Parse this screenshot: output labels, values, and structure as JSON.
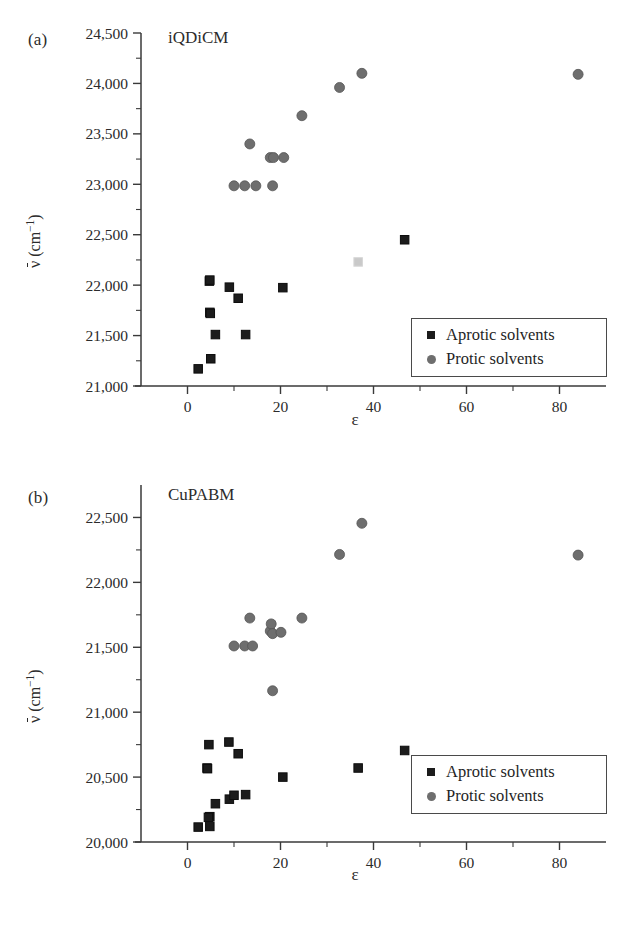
{
  "figure": {
    "xlabel": "ε",
    "ylabel_prefix": "ν",
    "ylabel_suffix": " (cm",
    "ylabel_exp": "−1",
    "ylabel_close": ")"
  },
  "legend": {
    "aprotic_label": "Aprotic solvents",
    "protic_label": "Protic solvents",
    "aprotic_color": "#1c1c1c",
    "protic_color": "#6e6e6e"
  },
  "chart_data": [
    {
      "type": "scatter",
      "panel": "(a)",
      "title": "iQDiCM",
      "xlabel": "ε",
      "ylabel": "ν̄ (cm⁻¹)",
      "xlim": [
        -10,
        90
      ],
      "ylim": [
        21000,
        24500
      ],
      "xticks": [
        0,
        20,
        40,
        60,
        80
      ],
      "xtick_labels": [
        "0",
        "20",
        "40",
        "60",
        "80"
      ],
      "xminor": [
        10,
        30,
        50,
        70
      ],
      "yticks": [
        21000,
        21500,
        22000,
        22500,
        23000,
        23500,
        24000,
        24500
      ],
      "ytick_labels": [
        "21,000",
        "21,500",
        "22,000",
        "22,500",
        "23,000",
        "23,500",
        "24,000",
        "24,500"
      ],
      "yminor": [
        21250,
        21750,
        22250,
        22750,
        23250,
        23750,
        24250
      ],
      "grid": false,
      "legend_position": "bottom-right",
      "series": [
        {
          "name": "Aprotic solvents",
          "marker": "square",
          "color": "#1c1c1c",
          "points": [
            {
              "x": 2.3,
              "y": 21170
            },
            {
              "x": 5.0,
              "y": 21270
            },
            {
              "x": 4.8,
              "y": 21730
            },
            {
              "x": 4.9,
              "y": 21720
            },
            {
              "x": 4.7,
              "y": 22040
            },
            {
              "x": 4.8,
              "y": 22050
            },
            {
              "x": 6.0,
              "y": 21510
            },
            {
              "x": 9.0,
              "y": 21980
            },
            {
              "x": 10.9,
              "y": 21870
            },
            {
              "x": 12.5,
              "y": 21510
            },
            {
              "x": 20.5,
              "y": 21975
            },
            {
              "x": 46.7,
              "y": 22450
            },
            {
              "x": 36.7,
              "y": 22230,
              "faint": true
            }
          ]
        },
        {
          "name": "Protic solvents",
          "marker": "circle",
          "color": "#6e6e6e",
          "points": [
            {
              "x": 10.0,
              "y": 22985
            },
            {
              "x": 12.3,
              "y": 22985
            },
            {
              "x": 14.7,
              "y": 22985
            },
            {
              "x": 18.3,
              "y": 22985
            },
            {
              "x": 13.4,
              "y": 23400
            },
            {
              "x": 17.8,
              "y": 23265
            },
            {
              "x": 18.5,
              "y": 23265
            },
            {
              "x": 20.7,
              "y": 23265
            },
            {
              "x": 24.6,
              "y": 23680
            },
            {
              "x": 32.7,
              "y": 23960
            },
            {
              "x": 37.5,
              "y": 24100
            },
            {
              "x": 84.0,
              "y": 24090
            }
          ]
        }
      ]
    },
    {
      "type": "scatter",
      "panel": "(b)",
      "title": "CuPABM",
      "xlabel": "ε",
      "ylabel": "ν̄ (cm⁻¹)",
      "xlim": [
        -10,
        90
      ],
      "ylim": [
        20000,
        22750
      ],
      "xticks": [
        0,
        20,
        40,
        60,
        80
      ],
      "xtick_labels": [
        "0",
        "20",
        "40",
        "60",
        "80"
      ],
      "xminor": [
        10,
        30,
        50,
        70
      ],
      "yticks": [
        20000,
        20500,
        21000,
        21500,
        22000,
        22500
      ],
      "ytick_labels": [
        "20,000",
        "20,500",
        "21,000",
        "21,500",
        "22,000",
        "22,500"
      ],
      "yminor": [
        20250,
        20750,
        21250,
        21750,
        22250
      ],
      "grid": false,
      "legend_position": "bottom-right",
      "series": [
        {
          "name": "Aprotic solvents",
          "marker": "square",
          "color": "#1c1c1c",
          "points": [
            {
              "x": 2.3,
              "y": 20115
            },
            {
              "x": 4.8,
              "y": 20120
            },
            {
              "x": 4.8,
              "y": 20195
            },
            {
              "x": 4.5,
              "y": 20190
            },
            {
              "x": 4.2,
              "y": 20570
            },
            {
              "x": 4.3,
              "y": 20565
            },
            {
              "x": 4.6,
              "y": 20750
            },
            {
              "x": 6.0,
              "y": 20295
            },
            {
              "x": 8.9,
              "y": 20770
            },
            {
              "x": 9.0,
              "y": 20330
            },
            {
              "x": 10.0,
              "y": 20360
            },
            {
              "x": 10.9,
              "y": 20680
            },
            {
              "x": 12.5,
              "y": 20365
            },
            {
              "x": 20.5,
              "y": 20500
            },
            {
              "x": 36.7,
              "y": 20570
            },
            {
              "x": 46.7,
              "y": 20705
            }
          ]
        },
        {
          "name": "Protic solvents",
          "marker": "circle",
          "color": "#6e6e6e",
          "points": [
            {
              "x": 10.0,
              "y": 21510
            },
            {
              "x": 12.3,
              "y": 21510
            },
            {
              "x": 14.0,
              "y": 21510
            },
            {
              "x": 13.4,
              "y": 21725
            },
            {
              "x": 17.8,
              "y": 21625
            },
            {
              "x": 18.0,
              "y": 21680
            },
            {
              "x": 18.3,
              "y": 21605
            },
            {
              "x": 20.1,
              "y": 21615
            },
            {
              "x": 18.3,
              "y": 21165
            },
            {
              "x": 24.6,
              "y": 21725
            },
            {
              "x": 32.7,
              "y": 22215
            },
            {
              "x": 37.5,
              "y": 22455
            },
            {
              "x": 84.0,
              "y": 22210
            }
          ]
        }
      ]
    }
  ]
}
